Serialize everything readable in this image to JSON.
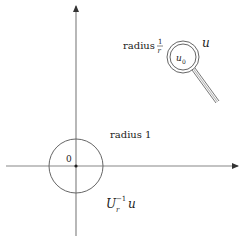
{
  "diagram": {
    "labels": {
      "radius_small": "radius",
      "radius_small_frac_num": "1",
      "radius_small_frac_den": "r",
      "u": "u",
      "u0": "u",
      "u0_sub": "0",
      "radius_unit": "radius 1",
      "origin": "0",
      "transformed_U": "U",
      "transformed_sub": "r",
      "transformed_sup": "−1",
      "transformed_u": "u"
    },
    "colors": {
      "stroke": "#555555",
      "axis": "#888888",
      "text": "#222222"
    }
  }
}
